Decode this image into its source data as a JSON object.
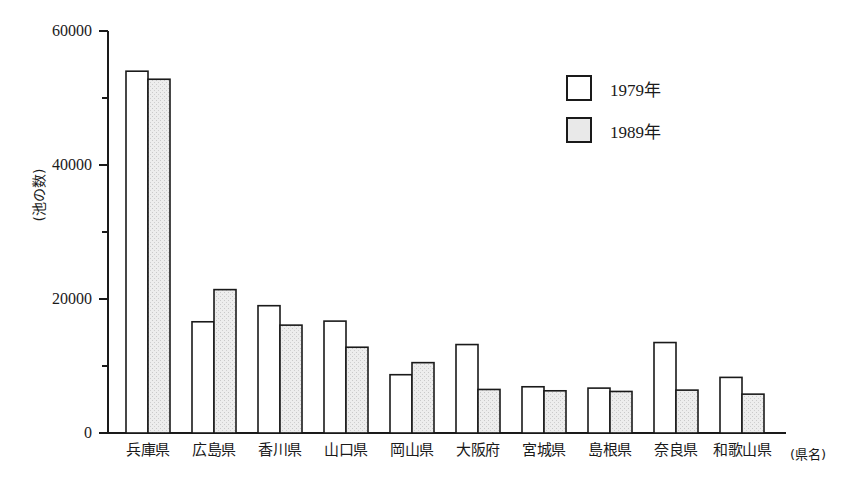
{
  "chart_data": {
    "type": "bar",
    "title": "",
    "subtitle": "",
    "xlabel": "(県名)",
    "ylabel": "(池の数)",
    "ylim": [
      0,
      60000
    ],
    "ytick_labels": [
      "0",
      "20000",
      "40000",
      "60000"
    ],
    "ytick_values": [
      0,
      20000,
      40000,
      60000
    ],
    "yminor_ticks": [
      10000,
      30000,
      50000
    ],
    "grid": false,
    "legend_position": "upper-right",
    "categories": [
      "兵庫県",
      "広島県",
      "香川県",
      "山口県",
      "岡山県",
      "大阪府",
      "宮城県",
      "島根県",
      "奈良県",
      "和歌山県"
    ],
    "series": [
      {
        "name": "1979年",
        "fill": "#ffffff",
        "values": [
          54000,
          16600,
          19000,
          16700,
          8700,
          13200,
          6900,
          6700,
          13500,
          8300
        ]
      },
      {
        "name": "1989年",
        "fill": "#e9e9e9",
        "values": [
          52800,
          21400,
          16100,
          12800,
          10500,
          6500,
          6300,
          6200,
          6400,
          5800
        ]
      }
    ]
  },
  "legend": {
    "items": [
      {
        "label": "1979年",
        "swatch": "white-box"
      },
      {
        "label": "1989年",
        "swatch": "gray-box"
      }
    ]
  },
  "colors": {
    "axis": "#1a1a1a",
    "bar_1979": "#ffffff",
    "bar_1989": "#e9e9e9",
    "bar_outline": "#1a1a1a",
    "background": "#ffffff"
  }
}
